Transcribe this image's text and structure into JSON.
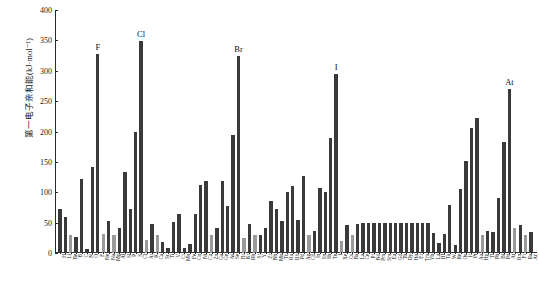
{
  "chart_data": {
    "type": "bar",
    "title": "",
    "xlabel": "",
    "ylabel": "第一电子亲和能(kJ·mol⁻¹)",
    "ylim": [
      0,
      400
    ],
    "ytick_labels": [
      "0",
      "50",
      "100",
      "150",
      "200",
      "250",
      "300",
      "350",
      "400"
    ],
    "ytick_values": [
      0,
      50,
      100,
      150,
      200,
      250,
      300,
      350,
      400
    ],
    "grid": false,
    "legend": false,
    "annotations": [
      {
        "label": "F",
        "category": "F",
        "value": 328
      },
      {
        "label": "Cl",
        "category": "Cl",
        "value": 349
      },
      {
        "label": "Br",
        "category": "Br",
        "value": 325
      },
      {
        "label": "I",
        "category": "I",
        "value": 295
      },
      {
        "label": "At",
        "category": "At",
        "value": 270
      }
    ],
    "categories": [
      "H",
      "Li",
      "Be",
      "B",
      "C",
      "N",
      "O",
      "F",
      "Ne",
      "Na",
      "Mg",
      "Al",
      "Si",
      "P",
      "S",
      "Cl",
      "Ar",
      "K",
      "Ca",
      "Sc",
      "Ti",
      "V",
      "Cr",
      "Mn",
      "Fe",
      "Co",
      "Ni",
      "Cu",
      "Zn",
      "Ga",
      "Ge",
      "As",
      "Se",
      "Br",
      "Kr",
      "Rb",
      "Sr",
      "Y",
      "Zr",
      "Nb",
      "Mo",
      "Tc",
      "Ru",
      "Rh",
      "Pd",
      "Ag",
      "Cd",
      "In",
      "Sn",
      "Sb",
      "Te",
      "I",
      "Xe",
      "Cs",
      "Ba",
      "La",
      "Ce",
      "Pr",
      "Nd",
      "Pm",
      "Sm",
      "Eu",
      "Gd",
      "Tb",
      "Dy",
      "Ho",
      "Er",
      "Tm",
      "Yb",
      "Lu",
      "Hf",
      "Ta",
      "W",
      "Re",
      "Os",
      "Ir",
      "Pt",
      "Au",
      "Hg",
      "Tl",
      "Pb",
      "Bi",
      "Po",
      "At",
      "Rn",
      "Fr",
      "Ra",
      "Ac"
    ],
    "values": [
      73,
      60,
      30,
      27,
      122,
      7,
      141,
      328,
      32,
      53,
      30,
      42,
      134,
      72,
      200,
      349,
      22,
      48,
      30,
      18,
      8,
      51,
      65,
      8,
      15,
      64,
      112,
      119,
      30,
      41,
      119,
      78,
      195,
      325,
      25,
      47,
      30,
      30,
      41,
      86,
      72,
      53,
      101,
      110,
      54,
      126,
      30,
      37,
      107,
      101,
      190,
      295,
      20,
      46,
      30,
      48,
      50,
      50,
      50,
      50,
      50,
      50,
      50,
      50,
      50,
      50,
      50,
      50,
      50,
      33,
      17,
      31,
      79,
      14,
      106,
      151,
      205,
      223,
      30,
      36,
      35,
      91,
      183,
      270,
      41,
      46,
      30,
      34
    ],
    "bar_shades": [
      "dark",
      "dark",
      "light",
      "dark",
      "dark",
      "dark",
      "dark",
      "dark",
      "light",
      "dark",
      "light",
      "dark",
      "dark",
      "dark",
      "dark",
      "dark",
      "light",
      "dark",
      "light",
      "dark",
      "dark",
      "dark",
      "dark",
      "dark",
      "dark",
      "dark",
      "dark",
      "dark",
      "light",
      "dark",
      "dark",
      "dark",
      "dark",
      "dark",
      "light",
      "dark",
      "light",
      "dark",
      "dark",
      "dark",
      "dark",
      "dark",
      "dark",
      "dark",
      "dark",
      "dark",
      "light",
      "dark",
      "dark",
      "dark",
      "dark",
      "dark",
      "light",
      "dark",
      "light",
      "dark",
      "dark",
      "dark",
      "dark",
      "dark",
      "dark",
      "dark",
      "dark",
      "dark",
      "dark",
      "dark",
      "dark",
      "dark",
      "dark",
      "dark",
      "dark",
      "dark",
      "dark",
      "dark",
      "dark",
      "dark",
      "dark",
      "dark",
      "light",
      "dark",
      "dark",
      "dark",
      "dark",
      "dark",
      "light",
      "dark",
      "light",
      "dark"
    ],
    "colors": {
      "bar_dark": "#3a3a3a",
      "bar_light": "#9a9a9a",
      "axis": "#2b2b2b",
      "text": "#1a1a1a",
      "background": "#ffffff"
    }
  }
}
